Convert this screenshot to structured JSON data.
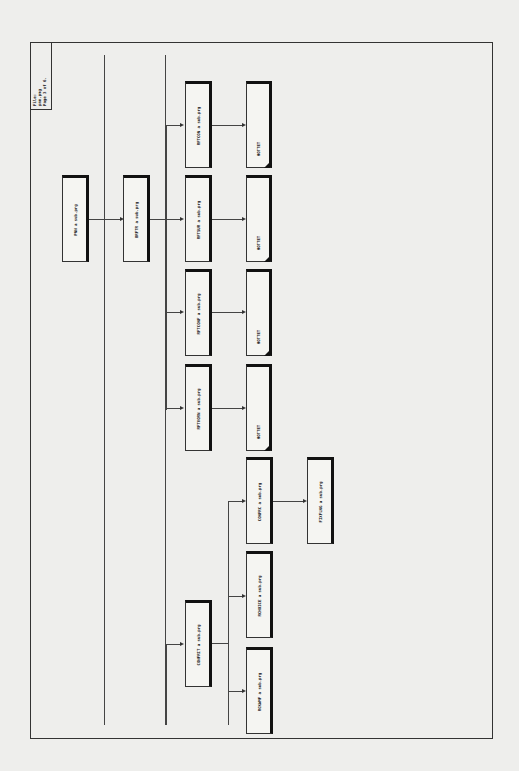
{
  "file_box": {
    "text": "File:\npnn.pmg\nPage 3 of 6."
  },
  "nodes": {
    "pnn": "PNN   a sub.prg",
    "brftr": "BRFTR  a sub.prg",
    "rftcon": "RFTCON  a sub.prg",
    "rftsur": "RFTSUR  a sub.prg",
    "rftconf": "RFTCONF  a sub.prg",
    "rftvorn": "RFTVORN  a sub.prg",
    "hottet1": "HOTTET",
    "hottet2": "HOTTET",
    "hottet3": "HOTTET",
    "hottet4": "HOTTET",
    "confrit": "CONFRIT  a sub.prg",
    "rckwmf": "RCKWMF  a sub.prg",
    "rchoice": "RCHOICE  a sub.prg",
    "confrc": "CONFRC  a sub.prg",
    "fixflng": "FIXFLNG  a sub.prg"
  }
}
